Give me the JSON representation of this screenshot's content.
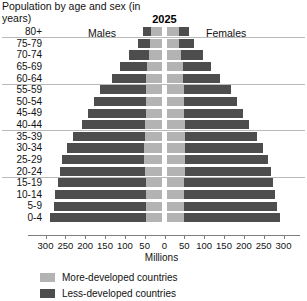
{
  "header": {
    "title": "Population by age and sex (in years)",
    "year": "2025",
    "males_label": "Males",
    "females_label": "Females"
  },
  "axis": {
    "title": "Millions",
    "tick_labels": [
      "300",
      "250",
      "200",
      "150",
      "100",
      "50",
      "0",
      "50",
      "100",
      "150",
      "200",
      "250",
      "300"
    ],
    "tick_values": [
      -300,
      -250,
      -200,
      -150,
      -100,
      -50,
      0,
      50,
      100,
      150,
      200,
      250,
      300
    ],
    "max": 300
  },
  "legend": {
    "items": [
      {
        "label": "More-developed countries",
        "color": "#b3b3b3"
      },
      {
        "label": "Less-developed countries",
        "color": "#4d4d4d"
      }
    ]
  },
  "colors": {
    "more_developed": "#b3b3b3",
    "less_developed": "#4d4d4d",
    "separator": "#b9b9b9",
    "axis": "#7d7d7d",
    "text": "#111111",
    "background": "#ffffff"
  },
  "chart_data": {
    "type": "bar",
    "subtype": "population-pyramid-stacked",
    "title": "Population by age and sex (in years)",
    "subtitle": "2025",
    "xlabel": "Millions",
    "ylabel": "",
    "xlim": [
      -300,
      300
    ],
    "grid": false,
    "legend_position": "bottom-left",
    "sides": [
      "Males",
      "Females"
    ],
    "categories": [
      "80+",
      "75-79",
      "70-74",
      "65-69",
      "60-64",
      "55-59",
      "50-54",
      "45-49",
      "40-44",
      "35-39",
      "30-34",
      "25-29",
      "20-24",
      "15-19",
      "10-14",
      "5-9",
      "0-4"
    ],
    "series": [
      {
        "name": "More-developed countries",
        "side": "Males",
        "color": "#b3b3b3",
        "values": [
          28,
          30,
          34,
          38,
          40,
          42,
          42,
          42,
          43,
          44,
          45,
          45,
          44,
          42,
          42,
          42,
          42
        ]
      },
      {
        "name": "Less-developed countries",
        "side": "Males",
        "color": "#4d4d4d",
        "values": [
          20,
          32,
          50,
          68,
          88,
          115,
          130,
          145,
          160,
          180,
          195,
          208,
          215,
          222,
          228,
          232,
          240
        ]
      },
      {
        "name": "More-developed countries",
        "side": "Females",
        "color": "#b3b3b3",
        "values": [
          30,
          32,
          36,
          40,
          42,
          44,
          44,
          44,
          45,
          46,
          46,
          46,
          45,
          43,
          43,
          43,
          43
        ]
      },
      {
        "name": "Less-developed countries",
        "side": "Females",
        "color": "#4d4d4d",
        "values": [
          25,
          38,
          55,
          72,
          92,
          118,
          133,
          148,
          163,
          182,
          197,
          210,
          217,
          224,
          230,
          234,
          242
        ]
      }
    ],
    "separator_after": [
      "80+",
      "60-64",
      "40-44",
      "20-24"
    ]
  }
}
